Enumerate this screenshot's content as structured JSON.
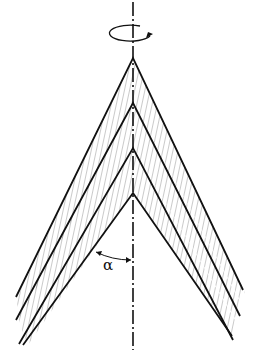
{
  "diagram": {
    "axis": {
      "x": 133,
      "top": 2,
      "bottom": 350,
      "style": "dash-dot"
    },
    "rotation_arrow": {
      "cx": 131,
      "cy": 33,
      "rx": 21,
      "ry": 8,
      "direction": "counterclockwise-view"
    },
    "cones": [
      {
        "apex_y": 58,
        "left_end": [
          16,
          297
        ],
        "right_end": [
          243,
          290
        ]
      },
      {
        "apex_y": 103,
        "left_end": [
          16,
          320
        ],
        "right_end": [
          240,
          316
        ]
      },
      {
        "apex_y": 148,
        "left_end": [
          19,
          344
        ],
        "right_end": [
          233,
          340
        ]
      },
      {
        "apex_y": 193,
        "left_end": [
          23,
          345
        ],
        "right_end": [
          232,
          336
        ]
      }
    ],
    "angle_label": "α",
    "colors": {
      "line": "#111111",
      "hatch": "#555555",
      "background": "#ffffff"
    }
  }
}
